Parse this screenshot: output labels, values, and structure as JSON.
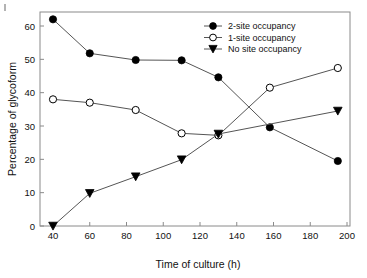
{
  "chart_data": {
    "type": "line",
    "title": "",
    "xlabel": "Time of culture (h)",
    "ylabel": "Percentage of glycoform",
    "xlim": [
      40,
      200
    ],
    "ylim": [
      0,
      65
    ],
    "xticks": [
      40,
      60,
      80,
      100,
      120,
      140,
      160,
      180,
      200
    ],
    "yticks": [
      0,
      10,
      20,
      30,
      40,
      50,
      60
    ],
    "grid": false,
    "legend_position": "top-right",
    "x": [
      40,
      60,
      85,
      110,
      130,
      158,
      195
    ],
    "series": [
      {
        "name": "2-site occupancy",
        "marker": "filled-circle",
        "color": "#000000",
        "x": [
          40,
          60,
          85,
          110,
          130,
          158,
          195
        ],
        "values": [
          62.0,
          51.8,
          49.8,
          49.7,
          44.6,
          29.6,
          19.5
        ]
      },
      {
        "name": "1-site occupancy",
        "marker": "open-circle",
        "color": "#000000",
        "x": [
          40,
          60,
          85,
          110,
          130,
          158,
          195
        ],
        "values": [
          38.0,
          37.0,
          34.8,
          27.8,
          27.2,
          41.5,
          47.4
        ]
      },
      {
        "name": "No site occupancy",
        "marker": "filled-triangle-down",
        "color": "#000000",
        "x": [
          40,
          60,
          85,
          110,
          130,
          195
        ],
        "values": [
          0.0,
          9.8,
          14.8,
          19.9,
          27.6,
          34.5
        ]
      }
    ]
  },
  "axes": {
    "x_title": "Time of culture (h)",
    "y_title": "Percentage of glycoform",
    "x_tick_labels": [
      "40",
      "60",
      "80",
      "100",
      "120",
      "140",
      "160",
      "180",
      "200"
    ],
    "y_tick_labels": [
      "0",
      "10",
      "20",
      "30",
      "40",
      "50",
      "60"
    ]
  },
  "legend": {
    "entries": [
      {
        "label": "2-site occupancy",
        "marker": "filled-circle"
      },
      {
        "label": "1-site occupancy",
        "marker": "open-circle"
      },
      {
        "label": "No site occupancy",
        "marker": "filled-triangle-down"
      }
    ]
  },
  "colors": {
    "line": "#555555",
    "marker": "#000000",
    "frame": "#8a8a8a",
    "text": "#111111"
  }
}
